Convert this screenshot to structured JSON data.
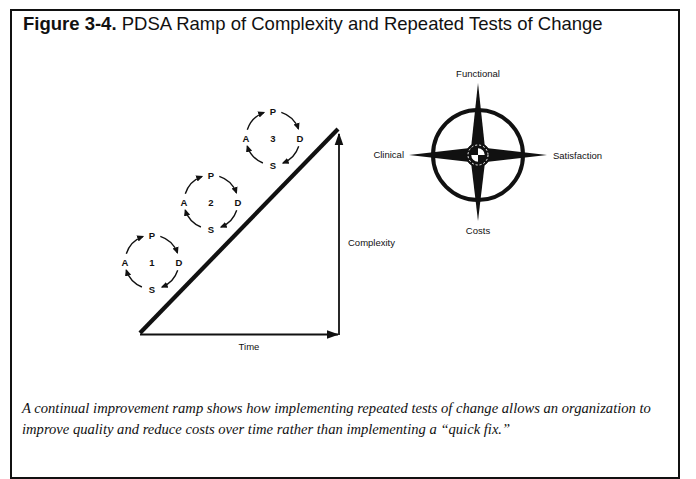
{
  "figure": {
    "label": "Figure 3-4.",
    "title": "PDSA Ramp of Complexity and Repeated Tests of Change",
    "caption": "A continual improvement ramp shows how implementing repeated tests of change allows an organization to improve quality and reduce costs over time rather than implementing a “quick fix.”"
  },
  "ramp": {
    "x_axis_label": "Time",
    "y_axis_label": "Complexity",
    "cycles": [
      {
        "number": "1",
        "top": "P",
        "right": "D",
        "bottom": "S",
        "left": "A"
      },
      {
        "number": "2",
        "top": "P",
        "right": "D",
        "bottom": "S",
        "left": "A"
      },
      {
        "number": "3",
        "top": "P",
        "right": "D",
        "bottom": "S",
        "left": "A"
      }
    ]
  },
  "compass": {
    "north": "Functional",
    "east": "Satisfaction",
    "south": "Costs",
    "west": "Clinical"
  },
  "colors": {
    "ink": "#111111",
    "background": "#ffffff"
  }
}
